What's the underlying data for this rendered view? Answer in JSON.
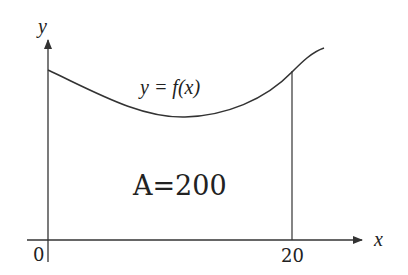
{
  "diagram": {
    "axes": {
      "x_label": "x",
      "y_label": "y",
      "origin_label": "0",
      "x_tick_label": "20"
    },
    "curve_label": "y = f(x)",
    "area_label": "A=200",
    "colors": {
      "line": "#333333",
      "text": "#222222",
      "background": "#ffffff"
    }
  }
}
